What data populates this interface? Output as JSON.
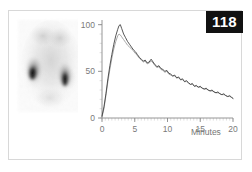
{
  "figure": {
    "number_badge": "118",
    "frame_border_color": "#d8d8d8",
    "background_color": "#ffffff"
  },
  "scintigram": {
    "name": "renal-scintigram",
    "description": "posterior renal scintigram showing two kidneys",
    "structures": [
      "left-kidney",
      "right-kidney"
    ],
    "colormap": "grayscale-inverted"
  },
  "chart_data": {
    "type": "line",
    "title": "",
    "subtitle": "",
    "xlabel": "Minutes",
    "ylabel": "",
    "xlim": [
      0,
      20
    ],
    "ylim": [
      0,
      105
    ],
    "grid": false,
    "legend_position": "none",
    "xticks": [
      0,
      5,
      10,
      15,
      20
    ],
    "xticklabels": [
      "0",
      "5",
      "10",
      "15",
      "20"
    ],
    "yticks": [
      0,
      50,
      100
    ],
    "yticklabels": [
      "0",
      "50",
      "100"
    ],
    "x_minor_tick_interval": 0.5,
    "y_minor_tick_interval": 10,
    "x": [
      0.0,
      0.3,
      0.6,
      0.9,
      1.2,
      1.5,
      1.8,
      2.1,
      2.4,
      2.6,
      2.8,
      3.0,
      3.3,
      3.6,
      3.9,
      4.2,
      4.5,
      4.8,
      5.1,
      5.4,
      5.7,
      6.0,
      6.3,
      6.6,
      6.9,
      7.2,
      7.5,
      7.8,
      8.1,
      8.4,
      8.7,
      9.0,
      9.3,
      9.6,
      9.9,
      10.2,
      10.5,
      10.8,
      11.1,
      11.4,
      11.7,
      12.0,
      12.3,
      12.6,
      12.9,
      13.2,
      13.5,
      13.8,
      14.1,
      14.4,
      14.7,
      15.0,
      15.3,
      15.6,
      15.9,
      16.2,
      16.5,
      16.8,
      17.1,
      17.4,
      17.7,
      18.0,
      18.3,
      18.6,
      18.9,
      19.2,
      19.5,
      19.8,
      20.0
    ],
    "series": [
      {
        "name": "right-kidney-curve",
        "color": "#3a3a3a",
        "values": [
          2,
          12,
          26,
          42,
          56,
          68,
          79,
          88,
          95,
          99,
          100,
          96,
          90,
          86,
          82,
          79,
          76,
          73,
          71,
          68,
          65,
          63,
          61,
          62,
          59,
          60,
          63,
          60,
          57,
          55,
          56,
          53,
          52,
          50,
          51,
          48,
          47,
          45,
          46,
          43,
          44,
          41,
          42,
          39,
          40,
          38,
          36,
          37,
          34,
          35,
          33,
          34,
          32,
          31,
          32,
          30,
          29,
          30,
          28,
          27,
          28,
          26,
          25,
          26,
          24,
          23,
          24,
          22,
          21
        ]
      },
      {
        "name": "left-kidney-curve",
        "color": "#9a9a9a",
        "values": [
          1,
          10,
          24,
          39,
          52,
          64,
          74,
          82,
          88,
          90,
          89,
          87,
          84,
          81,
          78,
          76,
          74,
          72,
          69,
          67,
          64,
          62,
          60,
          61,
          58,
          59,
          61,
          59,
          56,
          54,
          55,
          52,
          51,
          49,
          50,
          47,
          46,
          45,
          45,
          43,
          43,
          41,
          41,
          39,
          39,
          37,
          36,
          36,
          34,
          34,
          33,
          33,
          32,
          31,
          31,
          30,
          29,
          29,
          28,
          27,
          27,
          26,
          25,
          25,
          24,
          23,
          23,
          22,
          21
        ]
      }
    ]
  }
}
